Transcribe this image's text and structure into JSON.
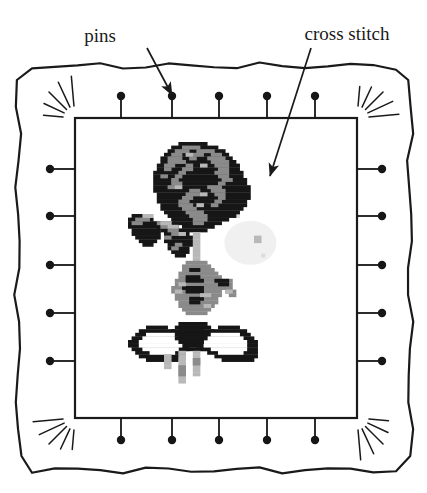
{
  "figure": {
    "background_color": "#ffffff",
    "ink_color": "#1a1a1a",
    "width": 427,
    "height": 493
  },
  "annotations": [
    {
      "id": "pins",
      "label": "pins",
      "label_x": 100,
      "label_y": 42,
      "arrow_start_x": 147,
      "arrow_start_y": 48,
      "arrow_end_x": 172,
      "arrow_end_y": 95,
      "target": "top-edge-pin-2"
    },
    {
      "id": "cross-stitch",
      "label": "cross stitch",
      "label_x": 289,
      "label_y": 40,
      "arrow_start_x": 297,
      "arrow_start_y": 48,
      "arrow_end_x": 270,
      "arrow_end_y": 176,
      "target": "rose-head"
    }
  ],
  "frame": {
    "name": "wavy-fabric-frame",
    "outer_left": 18,
    "outer_top": 66,
    "outer_right": 410,
    "outer_bottom": 470,
    "stroke_width": 2.2,
    "wave_amplitude": 2.6,
    "corner_radius": 14
  },
  "canvas_panel": {
    "name": "stitch-canvas",
    "left": 75,
    "top": 118,
    "right": 357,
    "bottom": 418,
    "stroke_width": 2.2,
    "fill": "#ffffff"
  },
  "pins": {
    "count_per_edge": 5,
    "head_radius": 4.2,
    "shaft_length": 26,
    "shaft_width": 1.8,
    "top": [
      121,
      172,
      219,
      267,
      315
    ],
    "bottom": [
      121,
      172,
      219,
      267,
      315
    ],
    "left": [
      169,
      216,
      265,
      313,
      361
    ],
    "right": [
      169,
      216,
      265,
      313,
      361
    ],
    "top_head_y": 96,
    "bottom_head_y": 440,
    "left_head_x": 50,
    "right_head_x": 382
  },
  "corner_bursts": {
    "name": "corner-sunburst-rays",
    "rays_per_corner": 5,
    "inner_offset": 6,
    "length_short": 26,
    "length_long": 42,
    "corners": [
      "top-left",
      "top-right",
      "bottom-left",
      "bottom-right"
    ]
  },
  "palette": {
    "black": "#161616",
    "dark": "#2a2a2a",
    "mid_gray": "#8a8a8a",
    "light_gray": "#b8b8b8",
    "pale_gray": "#dcdcdc",
    "ghost_gray": "#f0f0f0",
    "white": "#ffffff"
  },
  "embroidery": {
    "name": "rose-with-bow-cross-stitch",
    "cell_size": 3.6,
    "origin_x": 128,
    "origin_y": 142,
    "description": "Pixelated cross-stitch rose with leaves, stem and a tied bow",
    "parts": [
      {
        "name": "rose-head",
        "color_keys": [
          "black",
          "mid_gray",
          "light_gray"
        ]
      },
      {
        "name": "left-leaves",
        "color_keys": [
          "black",
          "mid_gray",
          "light_gray"
        ]
      },
      {
        "name": "stem-and-foliage",
        "color_keys": [
          "mid_gray",
          "light_gray",
          "black"
        ]
      },
      {
        "name": "bow",
        "color_keys": [
          "black",
          "white"
        ]
      },
      {
        "name": "ribbon-tails",
        "color_keys": [
          "light_gray",
          "mid_gray"
        ]
      },
      {
        "name": "ghost-smudge",
        "color_keys": [
          "ghost_gray",
          "pale_gray"
        ]
      }
    ],
    "grid": {
      "cols": 44,
      "rows": 70,
      "rose_head": [
        [
          14,
          0,
          8,
          1
        ],
        [
          12,
          1,
          13,
          1
        ],
        [
          11,
          2,
          16,
          1
        ],
        [
          10,
          3,
          18,
          1
        ],
        [
          9,
          4,
          20,
          1
        ],
        [
          9,
          5,
          21,
          1
        ],
        [
          8,
          6,
          23,
          1
        ],
        [
          8,
          7,
          23,
          1
        ],
        [
          7,
          8,
          25,
          1
        ],
        [
          7,
          9,
          25,
          1
        ],
        [
          7,
          10,
          26,
          1
        ],
        [
          7,
          11,
          26,
          1
        ],
        [
          7,
          12,
          27,
          1
        ],
        [
          7,
          13,
          27,
          1
        ],
        [
          8,
          14,
          26,
          1
        ],
        [
          8,
          15,
          26,
          1
        ],
        [
          8,
          16,
          25,
          1
        ],
        [
          9,
          17,
          24,
          1
        ],
        [
          9,
          18,
          23,
          1
        ],
        [
          10,
          19,
          21,
          1
        ],
        [
          11,
          20,
          19,
          1
        ],
        [
          12,
          21,
          16,
          1
        ],
        [
          13,
          22,
          13,
          1
        ],
        [
          15,
          23,
          9,
          1
        ],
        [
          16,
          24,
          6,
          1
        ]
      ],
      "rose_mid_patches": [
        [
          15,
          1,
          5,
          1
        ],
        [
          13,
          2,
          4,
          1
        ],
        [
          19,
          2,
          5,
          1
        ],
        [
          12,
          3,
          3,
          1
        ],
        [
          18,
          3,
          3,
          1
        ],
        [
          23,
          3,
          3,
          1
        ],
        [
          11,
          4,
          4,
          1
        ],
        [
          17,
          4,
          2,
          1
        ],
        [
          22,
          4,
          5,
          1
        ],
        [
          11,
          5,
          5,
          1
        ],
        [
          23,
          5,
          5,
          1
        ],
        [
          10,
          6,
          3,
          1
        ],
        [
          16,
          6,
          2,
          1
        ],
        [
          24,
          6,
          4,
          1
        ],
        [
          10,
          7,
          2,
          1
        ],
        [
          15,
          7,
          3,
          1
        ],
        [
          25,
          7,
          3,
          1
        ],
        [
          14,
          8,
          2,
          1
        ],
        [
          24,
          8,
          4,
          1
        ],
        [
          9,
          9,
          2,
          1
        ],
        [
          13,
          9,
          2,
          1
        ],
        [
          25,
          9,
          3,
          1
        ],
        [
          12,
          10,
          2,
          1
        ],
        [
          26,
          10,
          3,
          1
        ],
        [
          12,
          11,
          3,
          1
        ],
        [
          25,
          11,
          2,
          1
        ],
        [
          11,
          12,
          2,
          1
        ],
        [
          22,
          12,
          4,
          1
        ],
        [
          17,
          13,
          3,
          1
        ],
        [
          23,
          13,
          4,
          1
        ],
        [
          16,
          14,
          4,
          1
        ],
        [
          24,
          14,
          3,
          1
        ],
        [
          15,
          15,
          3,
          1
        ],
        [
          25,
          15,
          2,
          1
        ],
        [
          14,
          16,
          3,
          1
        ],
        [
          24,
          16,
          2,
          1
        ],
        [
          14,
          17,
          4,
          1
        ],
        [
          23,
          17,
          2,
          1
        ],
        [
          15,
          18,
          4,
          1
        ],
        [
          16,
          19,
          5,
          1
        ],
        [
          17,
          20,
          5,
          1
        ],
        [
          18,
          21,
          4,
          1
        ],
        [
          18,
          22,
          3,
          1
        ]
      ],
      "left_leaves": [
        [
          1,
          20,
          4,
          1
        ],
        [
          0,
          21,
          7,
          1
        ],
        [
          0,
          22,
          8,
          1
        ],
        [
          0,
          23,
          9,
          1
        ],
        [
          1,
          24,
          8,
          1
        ],
        [
          1,
          25,
          8,
          1
        ],
        [
          2,
          26,
          7,
          1
        ],
        [
          3,
          27,
          5,
          1
        ],
        [
          4,
          28,
          3,
          1
        ],
        [
          8,
          22,
          5,
          1
        ],
        [
          8,
          23,
          6,
          1
        ],
        [
          9,
          24,
          5,
          1
        ],
        [
          11,
          24,
          5,
          1
        ],
        [
          10,
          25,
          7,
          1
        ],
        [
          10,
          26,
          8,
          1
        ],
        [
          10,
          27,
          8,
          1
        ],
        [
          11,
          28,
          7,
          1
        ],
        [
          11,
          29,
          6,
          1
        ],
        [
          12,
          30,
          5,
          1
        ],
        [
          13,
          31,
          3,
          1
        ]
      ],
      "stem": [
        [
          18,
          25,
          2,
          1
        ],
        [
          18,
          26,
          2,
          1
        ],
        [
          18,
          27,
          2,
          1
        ],
        [
          18,
          28,
          2,
          1
        ],
        [
          18,
          29,
          2,
          1
        ],
        [
          18,
          30,
          2,
          1
        ],
        [
          18,
          31,
          2,
          1
        ],
        [
          18,
          32,
          2,
          1
        ],
        [
          18,
          33,
          2,
          1
        ],
        [
          18,
          34,
          2,
          1
        ],
        [
          18,
          35,
          2,
          1
        ],
        [
          18,
          36,
          2,
          1
        ],
        [
          18,
          37,
          2,
          1
        ],
        [
          18,
          38,
          2,
          1
        ],
        [
          18,
          39,
          2,
          1
        ],
        [
          18,
          40,
          2,
          1
        ],
        [
          18,
          41,
          2,
          1
        ],
        [
          18,
          42,
          2,
          1
        ],
        [
          18,
          43,
          2,
          1
        ],
        [
          18,
          44,
          2,
          1
        ]
      ],
      "foliage": [
        [
          16,
          33,
          6,
          1
        ],
        [
          15,
          34,
          8,
          1
        ],
        [
          15,
          35,
          9,
          1
        ],
        [
          14,
          36,
          11,
          1
        ],
        [
          14,
          37,
          12,
          1
        ],
        [
          13,
          38,
          13,
          1
        ],
        [
          13,
          39,
          14,
          1
        ],
        [
          12,
          40,
          15,
          1
        ],
        [
          12,
          41,
          14,
          1
        ],
        [
          13,
          42,
          13,
          1
        ],
        [
          13,
          43,
          12,
          1
        ],
        [
          14,
          44,
          11,
          1
        ],
        [
          14,
          45,
          10,
          1
        ],
        [
          15,
          46,
          8,
          1
        ],
        [
          16,
          47,
          6,
          1
        ],
        [
          24,
          38,
          5,
          1
        ],
        [
          25,
          39,
          4,
          1
        ],
        [
          26,
          40,
          3,
          1
        ],
        [
          27,
          41,
          3,
          1
        ],
        [
          28,
          42,
          2,
          1
        ]
      ],
      "bow": [
        [
          5,
          51,
          6,
          1
        ],
        [
          3,
          52,
          10,
          1
        ],
        [
          2,
          53,
          12,
          1
        ],
        [
          1,
          54,
          14,
          1
        ],
        [
          0,
          55,
          16,
          1
        ],
        [
          0,
          56,
          17,
          1
        ],
        [
          1,
          57,
          16,
          1
        ],
        [
          2,
          58,
          14,
          1
        ],
        [
          3,
          59,
          12,
          1
        ],
        [
          5,
          60,
          9,
          1
        ],
        [
          25,
          51,
          6,
          1
        ],
        [
          23,
          52,
          10,
          1
        ],
        [
          22,
          53,
          12,
          1
        ],
        [
          21,
          54,
          14,
          1
        ],
        [
          20,
          55,
          16,
          1
        ],
        [
          19,
          56,
          17,
          1
        ],
        [
          20,
          57,
          16,
          1
        ],
        [
          22,
          58,
          14,
          1
        ],
        [
          24,
          59,
          12,
          1
        ],
        [
          26,
          60,
          9,
          1
        ],
        [
          14,
          50,
          8,
          1
        ],
        [
          13,
          51,
          10,
          1
        ],
        [
          12,
          52,
          12,
          1
        ],
        [
          12,
          53,
          13,
          1
        ],
        [
          11,
          54,
          15,
          1
        ],
        [
          11,
          55,
          15,
          1
        ],
        [
          12,
          56,
          13,
          1
        ],
        [
          13,
          57,
          11,
          1
        ]
      ],
      "ribbon_tails": [
        [
          14,
          58,
          2,
          1
        ],
        [
          14,
          59,
          2,
          1
        ],
        [
          14,
          60,
          2,
          1
        ],
        [
          14,
          61,
          2,
          1
        ],
        [
          14,
          62,
          2,
          1
        ],
        [
          14,
          63,
          2,
          1
        ],
        [
          14,
          64,
          2,
          1
        ],
        [
          14,
          65,
          2,
          1
        ],
        [
          14,
          66,
          2,
          1
        ],
        [
          18,
          58,
          2,
          1
        ],
        [
          18,
          59,
          2,
          1
        ],
        [
          18,
          60,
          2,
          1
        ],
        [
          18,
          61,
          2,
          1
        ],
        [
          18,
          62,
          2,
          1
        ],
        [
          18,
          63,
          2,
          1
        ],
        [
          18,
          64,
          2,
          1
        ],
        [
          10,
          59,
          2,
          1
        ],
        [
          10,
          60,
          2,
          1
        ],
        [
          10,
          61,
          2,
          1
        ],
        [
          10,
          62,
          2,
          1
        ]
      ]
    }
  }
}
